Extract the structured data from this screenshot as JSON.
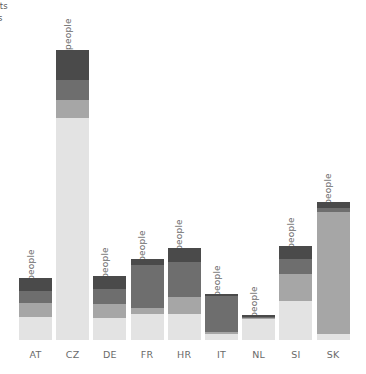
{
  "legend": {
    "items": [
      {
        "label": "ogists"
      },
      {
        "label": "gists"
      }
    ]
  },
  "chart_data": {
    "type": "bar",
    "subtype": "stacked",
    "title": "",
    "xlabel": "",
    "ylabel": "",
    "unit": "people",
    "ylim": [
      0,
      12.6
    ],
    "grid": false,
    "legend_position": "top-left",
    "categories": [
      "AT",
      "CZ",
      "DE",
      "FR",
      "HR",
      "IT",
      "NL",
      "SI",
      "SK"
    ],
    "totals": [
      2.7,
      12.6,
      2.8,
      3.5,
      4.0,
      2.0,
      1.1,
      4.1,
      6.0
    ],
    "total_labels": [
      "2.7 people",
      "12.6 people",
      "2.8 people",
      "3.5 people",
      "4.0 people",
      "2.0 people",
      "1.1 people",
      "4.1 people",
      "6.0 people"
    ],
    "segment_colors": [
      "#4a4a4a",
      "#6e6e6e",
      "#a6a6a6",
      "#e3e3e3"
    ],
    "series": [
      {
        "name": "segment-1",
        "color": "#4a4a4a",
        "values": [
          0.55,
          1.3,
          0.6,
          0.25,
          0.6,
          0.1,
          0.1,
          0.6,
          0.25
        ]
      },
      {
        "name": "segment-2",
        "color": "#6e6e6e",
        "values": [
          0.55,
          0.85,
          0.65,
          1.85,
          1.55,
          1.55,
          0.05,
          0.65,
          0.2
        ]
      },
      {
        "name": "segment-3",
        "color": "#a6a6a6",
        "values": [
          0.6,
          0.8,
          0.6,
          0.25,
          0.7,
          0.1,
          0.05,
          1.15,
          5.3
        ]
      },
      {
        "name": "segment-4",
        "color": "#e3e3e3",
        "values": [
          1.0,
          9.65,
          0.95,
          1.15,
          1.15,
          0.25,
          0.9,
          1.7,
          0.25
        ]
      }
    ]
  },
  "axis": {
    "tick_labels": [
      "AT",
      "CZ",
      "DE",
      "FR",
      "HR",
      "IT",
      "NL",
      "SI",
      "SK"
    ]
  }
}
